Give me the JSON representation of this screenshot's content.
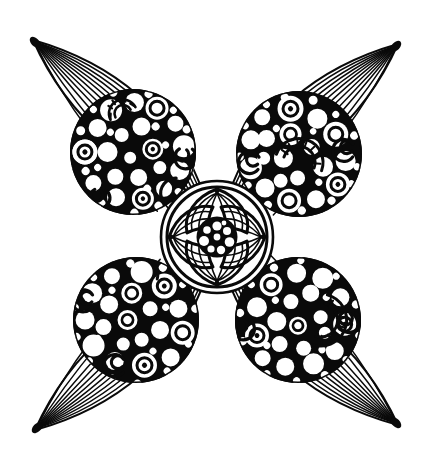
{
  "artwork": {
    "title": "Four-Petal Circle Mandala Line Art",
    "subject": "butterfly-like four petal flower mandala coloring page",
    "style": "black ink line art on white paper, zentangle / doodle coloring page",
    "canvas": {
      "width": 434,
      "height": 468,
      "background_color": "#ffffff",
      "ink_color": "#0a0a0a"
    },
    "center": {
      "x": 217,
      "y": 237
    }
  },
  "palette": {
    "ink": "#0a0a0a",
    "paper": "#ffffff"
  },
  "center_medallion": {
    "name": "central mandala rosette",
    "cx": 217,
    "cy": 237,
    "outer_radius": 56,
    "inner_ring_radius": 50,
    "hub_radius": 19,
    "petal_count": 4,
    "hatch_lines_per_petal": 7,
    "hub_dot_count": 9,
    "notch_dots": 4
  },
  "petals": [
    {
      "id": "petal-upper-left",
      "name": "upper-left petal",
      "direction": "northwest",
      "tip": {
        "x": 33,
        "y": 40
      },
      "base": {
        "x": 217,
        "y": 237
      },
      "rib_count": 11,
      "disc": {
        "cx": 133,
        "cy": 152,
        "rx": 66,
        "ry": 63,
        "rotation": -45
      },
      "motifs": [
        "small-circles",
        "concentric-rings",
        "spirals",
        "radial-fan",
        "stacked-bubbles"
      ]
    },
    {
      "id": "petal-upper-right",
      "name": "upper-right petal",
      "direction": "northeast",
      "tip": {
        "x": 398,
        "y": 44
      },
      "base": {
        "x": 217,
        "y": 237
      },
      "rib_count": 11,
      "disc": {
        "cx": 299,
        "cy": 154,
        "rx": 66,
        "ry": 63,
        "rotation": 45
      },
      "motifs": [
        "small-circles",
        "concentric-rings",
        "spirals",
        "radial-fan",
        "crescent-arcs"
      ]
    },
    {
      "id": "petal-lower-left",
      "name": "lower-left petal",
      "direction": "southwest",
      "tip": {
        "x": 35,
        "y": 430
      },
      "base": {
        "x": 217,
        "y": 237
      },
      "rib_count": 11,
      "disc": {
        "cx": 136,
        "cy": 320,
        "rx": 66,
        "ry": 63,
        "rotation": 45
      },
      "motifs": [
        "small-circles",
        "concentric-rings",
        "spirals",
        "bubble-cluster"
      ]
    },
    {
      "id": "petal-lower-right",
      "name": "lower-right petal",
      "direction": "southeast",
      "tip": {
        "x": 398,
        "y": 425
      },
      "base": {
        "x": 217,
        "y": 237
      },
      "rib_count": 11,
      "disc": {
        "cx": 298,
        "cy": 320,
        "rx": 66,
        "ry": 63,
        "rotation": -45
      },
      "motifs": [
        "small-circles",
        "concentric-rings",
        "spirals",
        "radial-fan",
        "crescent-arcs"
      ]
    }
  ],
  "stroke_weights": {
    "petal_outline": 2.0,
    "petal_rib": 1.6,
    "disc_outline": 3.2,
    "motif_heavy": 3.4,
    "motif_medium": 2.4,
    "motif_light": 1.6,
    "medallion_outline": 3.0,
    "medallion_hatch": 1.7
  }
}
